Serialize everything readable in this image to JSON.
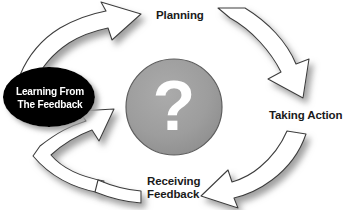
{
  "diagram": {
    "type": "cyclical-process-diagram",
    "background_color": "#ffffff",
    "center": {
      "symbol": "?",
      "icon_name": "question-mark",
      "circle_fill": "#9d9d9d",
      "circle_stroke": "#5a5a5a",
      "symbol_color": "#ffffff"
    },
    "highlight_node": {
      "line1": "Learning From",
      "line2": "The Feedback",
      "fill": "#000000",
      "text_color": "#ffffff"
    },
    "stages": [
      {
        "id": "planning",
        "label": "Planning",
        "position": "top"
      },
      {
        "id": "taking-action",
        "label": "Taking Action",
        "position": "right"
      },
      {
        "id": "receiving-feedback",
        "line1": "Receiving",
        "line2": "Feedback",
        "position": "bottom"
      }
    ],
    "arrows": [
      {
        "id": "arrow-to-planning",
        "from": "learning-from-the-feedback",
        "to": "planning",
        "direction": "up-right",
        "fill": "#ffffff",
        "stroke": "#3d3d3d"
      },
      {
        "id": "arrow-to-taking-action",
        "from": "planning",
        "to": "taking-action",
        "direction": "down-right",
        "fill": "#ffffff",
        "stroke": "#3d3d3d"
      },
      {
        "id": "arrow-to-receiving-feedback",
        "from": "taking-action",
        "to": "receiving-feedback",
        "direction": "down-left",
        "fill": "#ffffff",
        "stroke": "#3d3d3d"
      },
      {
        "id": "arrow-to-learning",
        "from": "receiving-feedback",
        "to": "learning-from-the-feedback",
        "direction": "up-left",
        "fill": "#ffffff",
        "stroke": "#3d3d3d"
      }
    ],
    "colors": {
      "arrow_fill": "#ffffff",
      "arrow_stroke": "#3d3d3d",
      "shadow": "#a8a8a8",
      "text": "#1a1a1a",
      "center_gray": "#9d9d9d",
      "node_black": "#000000"
    }
  }
}
